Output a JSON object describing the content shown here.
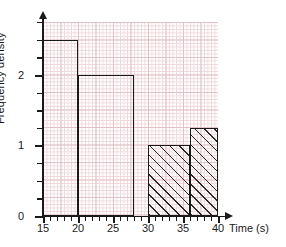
{
  "chart_data": {
    "type": "bar",
    "title": "",
    "xlabel": "Time (s)",
    "ylabel": "Frequency density",
    "xlim": [
      15,
      40
    ],
    "ylim": [
      0,
      2.75
    ],
    "grid": true,
    "legend": "none",
    "x_ticks": [
      {
        "value": 15,
        "label": "15"
      },
      {
        "value": 20,
        "label": "20"
      },
      {
        "value": 25,
        "label": "25"
      },
      {
        "value": 30,
        "label": "30"
      },
      {
        "value": 35,
        "label": "35"
      },
      {
        "value": 40,
        "label": "40"
      }
    ],
    "y_ticks": [
      {
        "value": 0,
        "label": "0"
      },
      {
        "value": 1,
        "label": "1"
      },
      {
        "value": 2,
        "label": "2"
      }
    ],
    "bars": [
      {
        "label": "15-20",
        "x_start": 15,
        "x_end": 20,
        "height": 2.5,
        "hatched": false
      },
      {
        "label": "20-28",
        "x_start": 20,
        "x_end": 28,
        "height": 2.0,
        "hatched": false
      },
      {
        "label": "30-36",
        "x_start": 30,
        "x_end": 36,
        "height": 1.0,
        "hatched": true
      },
      {
        "label": "36-40",
        "x_start": 36,
        "x_end": 40,
        "height": 1.25,
        "hatched": true
      }
    ],
    "colors": {
      "axis": "#1a1a1a",
      "bar_outline": "#1a1a1a",
      "grid_minor": "#f0d7da",
      "grid_major": "#e2c2c6",
      "hatch": "#2a2a2a",
      "background": "#ffffff"
    }
  }
}
